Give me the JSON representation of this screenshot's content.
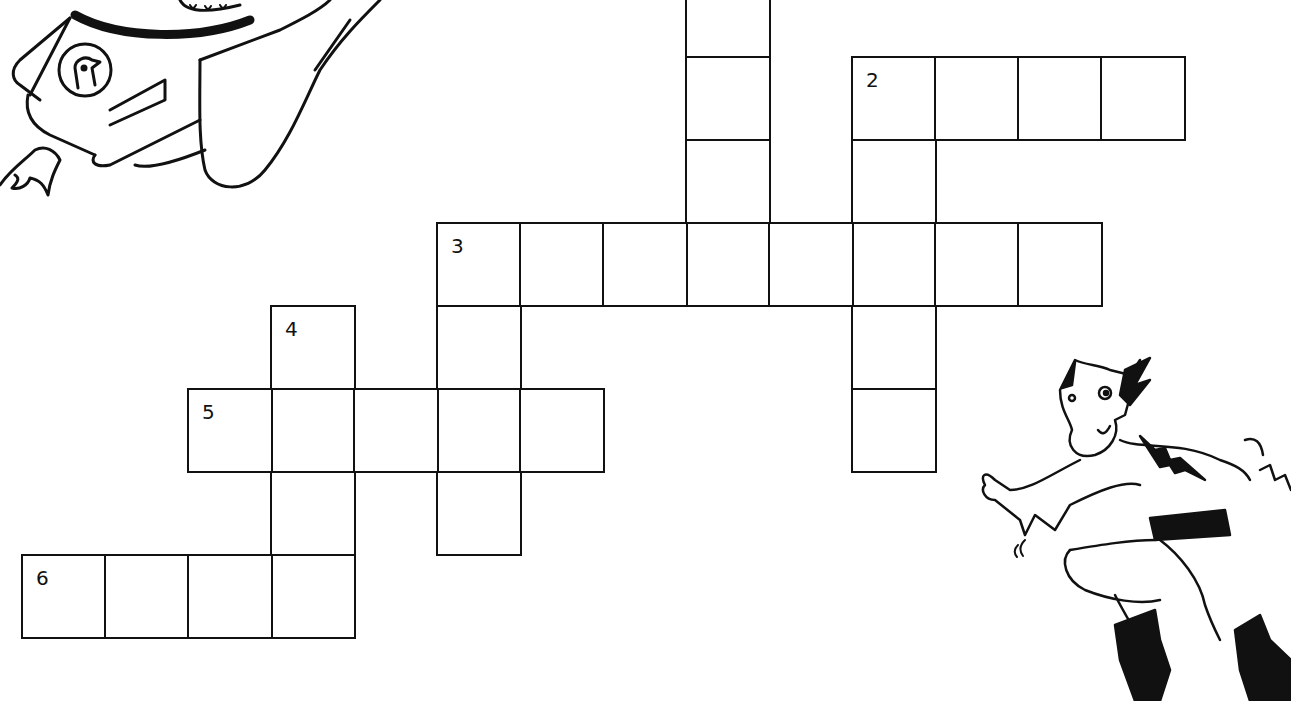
{
  "puzzle": {
    "type": "crossword",
    "cell_size": 83,
    "origin": {
      "x": 21,
      "y": -27
    },
    "clue_numbers": [
      {
        "number": "1",
        "col": 8,
        "row": 0,
        "visible": false
      },
      {
        "number": "2",
        "col": 10,
        "row": 1
      },
      {
        "number": "3",
        "col": 5,
        "row": 3
      },
      {
        "number": "4",
        "col": 3,
        "row": 4
      },
      {
        "number": "5",
        "col": 2,
        "row": 5
      },
      {
        "number": "6",
        "col": 0,
        "row": 7
      }
    ],
    "words": [
      {
        "id": "1-down",
        "start": [
          8,
          0
        ],
        "direction": "down",
        "length": 4
      },
      {
        "id": "2-across",
        "start": [
          10,
          1
        ],
        "direction": "across",
        "length": 4
      },
      {
        "id": "2-down",
        "start": [
          10,
          1
        ],
        "direction": "down",
        "length": 5
      },
      {
        "id": "3-across",
        "start": [
          5,
          3
        ],
        "direction": "across",
        "length": 8
      },
      {
        "id": "3-down",
        "start": [
          5,
          3
        ],
        "direction": "down",
        "length": 4
      },
      {
        "id": "4-down",
        "start": [
          3,
          4
        ],
        "direction": "down",
        "length": 4
      },
      {
        "id": "5-across",
        "start": [
          2,
          5
        ],
        "direction": "across",
        "length": 5
      },
      {
        "id": "6-across",
        "start": [
          0,
          7
        ],
        "direction": "across",
        "length": 4
      }
    ]
  },
  "illustrations": [
    {
      "name": "rocket-rider-illustration",
      "position": "top-left"
    },
    {
      "name": "superhero-illustration",
      "position": "bottom-right"
    }
  ]
}
